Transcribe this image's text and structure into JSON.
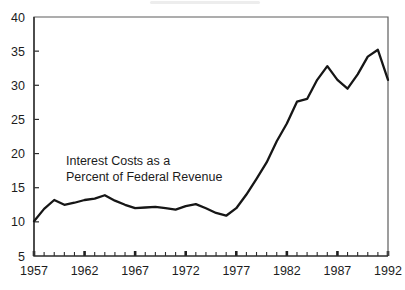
{
  "chart_data": {
    "type": "line",
    "title": "",
    "xlabel": "",
    "ylabel": "",
    "annotation": {
      "line1": "Interest Costs as a",
      "line2": "Percent of Federal Revenue"
    },
    "x": [
      1957,
      1958,
      1959,
      1960,
      1961,
      1962,
      1963,
      1964,
      1965,
      1966,
      1967,
      1968,
      1969,
      1970,
      1971,
      1972,
      1973,
      1974,
      1975,
      1976,
      1977,
      1978,
      1979,
      1980,
      1981,
      1982,
      1983,
      1984,
      1985,
      1986,
      1987,
      1988,
      1989,
      1990,
      1991,
      1992
    ],
    "values": [
      10.1,
      11.9,
      13.2,
      12.5,
      12.8,
      13.2,
      13.4,
      13.9,
      13.1,
      12.5,
      12.0,
      12.1,
      12.2,
      12.0,
      11.8,
      12.3,
      12.6,
      12.0,
      11.3,
      10.9,
      12.0,
      14.0,
      16.3,
      18.7,
      21.8,
      24.4,
      27.6,
      28.0,
      30.8,
      32.8,
      30.8,
      29.5,
      31.6,
      34.2,
      35.2,
      30.8
    ],
    "series": [
      {
        "name": "Interest Costs as a Percent of Federal Revenue",
        "values": [
          10.1,
          11.9,
          13.2,
          12.5,
          12.8,
          13.2,
          13.4,
          13.9,
          13.1,
          12.5,
          12.0,
          12.1,
          12.2,
          12.0,
          11.8,
          12.3,
          12.6,
          12.0,
          11.3,
          10.9,
          12.0,
          14.0,
          16.3,
          18.7,
          21.8,
          24.4,
          27.6,
          28.0,
          30.8,
          32.8,
          30.8,
          29.5,
          31.6,
          34.2,
          35.2,
          30.8
        ]
      }
    ],
    "xlim": [
      1957,
      1992
    ],
    "ylim": [
      5,
      40
    ],
    "ytick_labels": [
      "40",
      "35",
      "30",
      "25",
      "20",
      "15",
      "10",
      "5"
    ],
    "ytick_values": [
      40,
      35,
      30,
      25,
      20,
      15,
      10,
      5
    ],
    "xtick_labels": [
      "1957",
      "1962",
      "1967",
      "1972",
      "1977",
      "1982",
      "1987",
      "1992"
    ],
    "xtick_values": [
      1957,
      1962,
      1967,
      1972,
      1977,
      1982,
      1987,
      1992
    ],
    "minor_xtick_interval": 1,
    "grid": false,
    "legend": false,
    "line_color": "#161616",
    "axis_color": "#2b2b2b"
  }
}
